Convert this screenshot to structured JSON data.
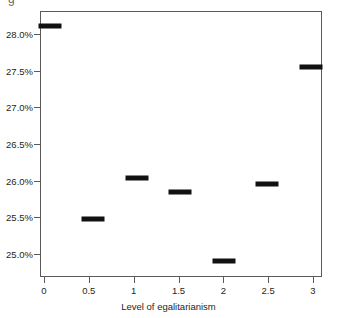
{
  "figure": {
    "background_color": "#ffffff",
    "frame_color": "#5a5a5a",
    "marker_color": "#111111",
    "text_color": "#231f20",
    "top_clip_text": "g"
  },
  "chart_data": {
    "type": "scatter",
    "title": "",
    "subtitle": "",
    "xlabel": "Level of egalitarianism",
    "ylabel": "",
    "grid": false,
    "legend": null,
    "marker_style": "horizontal-dash",
    "x": [
      0,
      0.5,
      1,
      1.5,
      2,
      2.5,
      3
    ],
    "values": [
      28.16,
      25.5,
      26.07,
      25.87,
      24.93,
      25.98,
      27.6
    ],
    "categories": [
      "0",
      "0.5",
      "1",
      "1.5",
      "2",
      "2.5",
      "3"
    ],
    "xlim": [
      -0.1,
      3.12
    ],
    "ylim": [
      24.72,
      28.35
    ],
    "xticks": [
      0,
      0.5,
      1,
      1.5,
      2,
      2.5,
      3
    ],
    "xticklabels": [
      "0",
      "0.5",
      "1",
      "1.5",
      "2",
      "2.5",
      "3"
    ],
    "yticks": [
      25.0,
      25.5,
      26.0,
      26.5,
      27.0,
      27.5,
      28.0
    ],
    "yticklabels": [
      "25.0%",
      "25.5%",
      "26.0%",
      "26.5%",
      "27.0%",
      "27.5%",
      "28.0%"
    ],
    "points": [
      {
        "x": 0,
        "xlabel": "0",
        "y": 28.16,
        "ylabel": "28.16%"
      },
      {
        "x": 0.5,
        "xlabel": "0.5",
        "y": 25.5,
        "ylabel": "25.50%"
      },
      {
        "x": 1,
        "xlabel": "1",
        "y": 26.07,
        "ylabel": "26.07%"
      },
      {
        "x": 1.5,
        "xlabel": "1.5",
        "y": 25.87,
        "ylabel": "25.87%"
      },
      {
        "x": 2,
        "xlabel": "2",
        "y": 24.93,
        "ylabel": "24.93%"
      },
      {
        "x": 2.5,
        "xlabel": "2.5",
        "y": 25.98,
        "ylabel": "25.98%"
      },
      {
        "x": 3,
        "xlabel": "3",
        "y": 27.6,
        "ylabel": "27.60%"
      }
    ]
  }
}
